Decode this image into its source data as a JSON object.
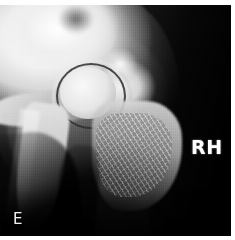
{
  "image": {
    "modality": "radiograph",
    "view_label": "hip-joint-radiograph",
    "background_color": "#0c0c0c",
    "bone_color": "#fafafa",
    "soft_tissue_color": "#9a9a9a",
    "border_color": "#ffffff",
    "width": 235,
    "height": 240
  },
  "markers": {
    "side_marker": "RH",
    "corner_marker": "E"
  },
  "regions": {
    "ilium": "ilium",
    "femoral_head": "femoral-head",
    "joint_space": "joint-space",
    "acetabular_rim": "acetabular-rim",
    "greater_trochanter": "greater-trochanter",
    "femur_proximal": "proximal-femur",
    "ischial_shaft": "ischial-shaft",
    "pubic_ramus": "pubic-ramus",
    "soft_tissue": "soft-tissue-mass"
  }
}
